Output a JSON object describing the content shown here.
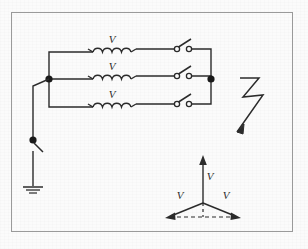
{
  "figure": {
    "kind": "three-phase-circuit-schematic",
    "background_color": "#fbfbfb",
    "ink_color": "#2b2b2b",
    "frame": {
      "x": 11,
      "y": 12,
      "width": 282,
      "height": 220,
      "stroke": "#8d8d8d"
    }
  },
  "circuit": {
    "phases": [
      {
        "id": "phase-top",
        "coil_label": "V",
        "y": 52,
        "switch_state": "open"
      },
      {
        "id": "phase-middle",
        "coil_label": "V",
        "y": 79,
        "switch_state": "open"
      },
      {
        "id": "phase-bottom",
        "coil_label": "V",
        "y": 107,
        "switch_state": "open"
      }
    ],
    "left_bus": {
      "x": 49,
      "node_dot_x": 49,
      "node_dot_y": 79
    },
    "right_bus": {
      "x": 211,
      "node_dot_x": 211,
      "node_dot_y": 79
    },
    "coil": {
      "turns": 4,
      "start_x": 93,
      "end_x": 131
    },
    "switch": {
      "pivot_x": 178,
      "contact_x": 193,
      "state": "open"
    },
    "neutral_branch": {
      "x": 33,
      "node_dot_y": 140,
      "switch_state": "open",
      "ground_y": 188
    },
    "lightning": {
      "label": "lightning-bolt-arrow",
      "direction": "down-left",
      "points": "240,78 258,78 243,98 262,96 234,136"
    }
  },
  "phasor_diagram": {
    "origin": {
      "x": 203,
      "y": 203
    },
    "vectors": [
      {
        "id": "phasor-up",
        "label": "V",
        "angle_deg": 90,
        "label_x": 209,
        "label_y": 178
      },
      {
        "id": "phasor-lower-left",
        "label": "V",
        "angle_deg": 210,
        "label_x": 179,
        "label_y": 197
      },
      {
        "id": "phasor-lower-right",
        "label": "V",
        "angle_deg": 330,
        "label_x": 224,
        "label_y": 197
      }
    ],
    "dashed_baseline": true,
    "dashed_vertical": true
  },
  "labels": {
    "coil_voltage": "V",
    "phasor_voltage": "V"
  }
}
